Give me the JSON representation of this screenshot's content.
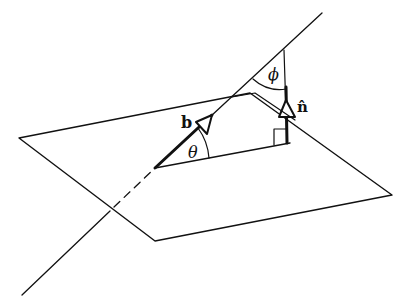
{
  "diagram": {
    "labels": {
      "b": "b",
      "n": "n̂",
      "theta": "θ",
      "phi": "ϕ"
    },
    "colors": {
      "stroke": "#111111",
      "background": "#ffffff"
    }
  }
}
